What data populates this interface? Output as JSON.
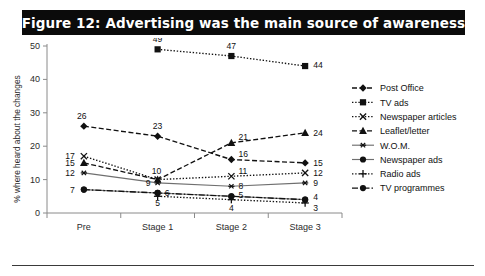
{
  "figure": {
    "title": "Figure 12: Advertising was the main source of awareness",
    "banner_color": "#0b0b0b",
    "banner_text_color": "#ffffff"
  },
  "chart_data": {
    "type": "line",
    "title": "Figure 12: Advertising was the main source of awareness",
    "xlabel": "",
    "ylabel": "% where heard about the changes",
    "categories": [
      "Pre",
      "Stage 1",
      "Stage 2",
      "Stage 3"
    ],
    "yticks": [
      0,
      10,
      20,
      30,
      40,
      50
    ],
    "ylim": [
      0,
      50
    ],
    "grid": false,
    "legend_position": "right",
    "series": [
      {
        "name": "Post Office",
        "marker": "diamond",
        "line": "dashed",
        "values": [
          26,
          23,
          16,
          15
        ]
      },
      {
        "name": "TV ads",
        "marker": "square",
        "line": "dotted",
        "values": [
          null,
          49,
          47,
          44
        ]
      },
      {
        "name": "Newspaper articles",
        "marker": "cross-x",
        "line": "dotted",
        "values": [
          17,
          10,
          11,
          12
        ]
      },
      {
        "name": "Leaflet/letter",
        "marker": "triangle",
        "line": "dashed",
        "values": [
          15,
          10,
          21,
          24
        ]
      },
      {
        "name": "W.O.M.",
        "marker": "asterisk",
        "line": "solid",
        "values": [
          12,
          9,
          8,
          9
        ]
      },
      {
        "name": "Newspaper ads",
        "marker": "circle",
        "line": "solid",
        "values": [
          7,
          6,
          5,
          4
        ]
      },
      {
        "name": "Radio ads",
        "marker": "plus",
        "line": "dotted",
        "values": [
          null,
          5,
          4,
          3
        ]
      },
      {
        "name": "TV programmes",
        "marker": "circle",
        "line": "dashdot",
        "values": [
          7,
          6,
          5,
          4
        ]
      }
    ],
    "point_labels": {
      "Pre": [
        "26",
        "17",
        "15",
        "12",
        "7"
      ],
      "Stage 1": [
        "23",
        "10",
        "9",
        "6",
        "5",
        "49"
      ],
      "Stage 2": [
        "47",
        "21",
        "16",
        "11",
        "8",
        "5",
        "4"
      ],
      "Stage 3": [
        "44",
        "24",
        "15",
        "12",
        "9",
        "4",
        "3"
      ]
    }
  },
  "legend": {
    "items": [
      {
        "label": "Post Office",
        "marker": "diamond-marker"
      },
      {
        "label": "TV ads",
        "marker": "square-marker"
      },
      {
        "label": "Newspaper articles",
        "marker": "x-marker"
      },
      {
        "label": "Leaflet/letter",
        "marker": "triangle-marker"
      },
      {
        "label": "W.O.M.",
        "marker": "asterisk-marker"
      },
      {
        "label": "Newspaper ads",
        "marker": "circle-marker"
      },
      {
        "label": "Radio ads",
        "marker": "plus-marker"
      },
      {
        "label": "TV programmes",
        "marker": "circle-marker"
      }
    ]
  },
  "axes": {
    "y_label": "% where heard about the changes",
    "y_ticks": [
      "0",
      "10",
      "20",
      "30",
      "40",
      "50"
    ],
    "x_categories": [
      "Pre",
      "Stage 1",
      "Stage 2",
      "Stage 3"
    ]
  }
}
